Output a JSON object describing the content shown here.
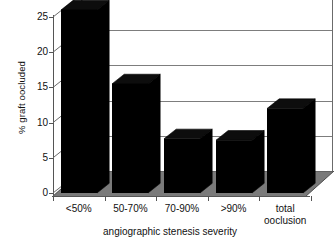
{
  "chart_data": {
    "type": "bar",
    "title": "",
    "subtitle": "",
    "xlabel": "angiographic stenesis severity",
    "ylabel": "% graft oocluded",
    "categories": [
      "<50%",
      "50-70%",
      "70-90%",
      ">90%",
      "total\nooclusion"
    ],
    "values": [
      26.0,
      15.5,
      7.7,
      7.5,
      12.0
    ],
    "ytick_labels": [
      "0",
      "5",
      "10",
      "15",
      "20",
      "25"
    ],
    "ytick_values": [
      0,
      5,
      10,
      15,
      20,
      25
    ],
    "ylim": [
      0,
      26.5
    ],
    "grid": true,
    "legend": "none",
    "bar_color": "#000000",
    "floor_color": "#7a7a7a",
    "gridline_color": "#7d7d7d",
    "background_color": "#ffffff",
    "style": "3d-perspective-column"
  }
}
